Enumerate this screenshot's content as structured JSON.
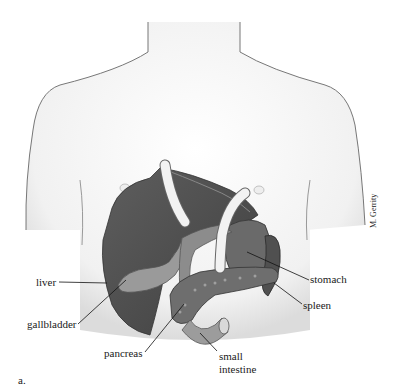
{
  "figure": {
    "panel_label": "a.",
    "credit": "M. Gerrity",
    "labels": {
      "liver": "liver",
      "gallbladder": "gallbladder",
      "pancreas": "pancreas",
      "small_intestine_line1": "small",
      "small_intestine_line2": "intestine",
      "stomach": "stomach",
      "spleen": "spleen"
    }
  }
}
